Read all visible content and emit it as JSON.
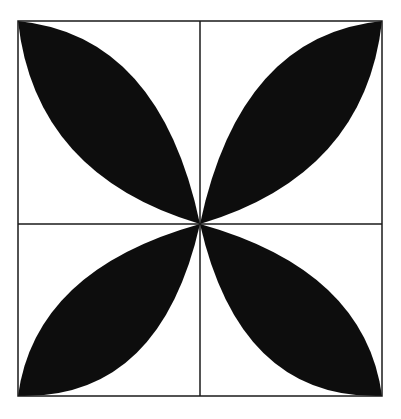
{
  "diagram": {
    "colors": {
      "fill": "#0d0d0d",
      "line": "#1a1a1a",
      "background": "#ffffff"
    },
    "square": {
      "x": 18,
      "y": 21,
      "width": 364,
      "height": 375
    },
    "center": {
      "x": 200,
      "y": 224
    },
    "petals": [
      "top-left",
      "top-right",
      "bottom-left",
      "bottom-right"
    ]
  }
}
